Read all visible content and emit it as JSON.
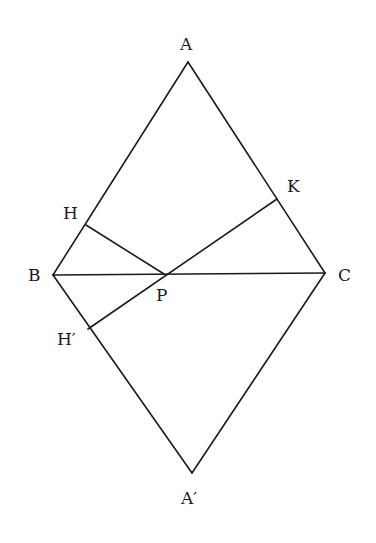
{
  "diagram": {
    "type": "geometry",
    "points": {
      "A": {
        "x": 188,
        "y": 62,
        "label": "A"
      },
      "B": {
        "x": 53,
        "y": 275,
        "label": "B"
      },
      "C": {
        "x": 325,
        "y": 273,
        "label": "C"
      },
      "A2": {
        "x": 192,
        "y": 473,
        "label": "A′"
      },
      "P": {
        "x": 164,
        "y": 274,
        "label": "P"
      },
      "H": {
        "x": 86,
        "y": 225,
        "label": "H"
      },
      "H2": {
        "x": 88,
        "y": 329,
        "label": "H′"
      },
      "K": {
        "x": 277,
        "y": 199,
        "label": "K"
      }
    },
    "segments": [
      [
        "A",
        "B"
      ],
      [
        "A",
        "C"
      ],
      [
        "B",
        "A2"
      ],
      [
        "C",
        "A2"
      ],
      [
        "B",
        "C"
      ],
      [
        "H",
        "P"
      ],
      [
        "H2",
        "K"
      ]
    ],
    "labels": {
      "A": {
        "text": "A",
        "x": 180,
        "y": 50
      },
      "B": {
        "text": "B",
        "x": 28,
        "y": 281
      },
      "C": {
        "text": "C",
        "x": 338,
        "y": 281
      },
      "A2": {
        "text": "A′",
        "x": 181,
        "y": 504
      },
      "P": {
        "text": "P",
        "x": 156,
        "y": 301
      },
      "H": {
        "text": "H",
        "x": 63,
        "y": 219
      },
      "H2": {
        "text": "H′",
        "x": 57,
        "y": 345
      },
      "K": {
        "text": "K",
        "x": 287,
        "y": 192
      }
    }
  }
}
